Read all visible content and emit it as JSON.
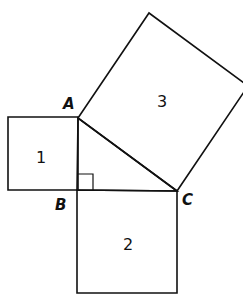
{
  "diagram": {
    "stroke_color": "#111111",
    "background": "#ffffff",
    "vertices": {
      "A": {
        "label": "A",
        "x": 78,
        "y": 118
      },
      "B": {
        "label": "B",
        "x": 77,
        "y": 190
      },
      "C": {
        "label": "C",
        "x": 177,
        "y": 191
      }
    },
    "squares": [
      {
        "id": "square-1",
        "label": "1",
        "side": "AB",
        "points": "8,117 78,117 78,190 8,190"
      },
      {
        "id": "square-2",
        "label": "2",
        "side": "BC",
        "points": "77,190 177,191 177,293 77,293"
      },
      {
        "id": "square-3",
        "label": "3",
        "side": "AC",
        "points": "78,118 149,13 248,86 177,191"
      }
    ],
    "triangle": {
      "points": "78,118 77,190 177,191",
      "right_angle_at": "B"
    },
    "labels": {
      "vertex_a": "A",
      "vertex_b": "B",
      "vertex_c": "C",
      "square_1": "1",
      "square_2": "2",
      "square_3": "3"
    }
  }
}
